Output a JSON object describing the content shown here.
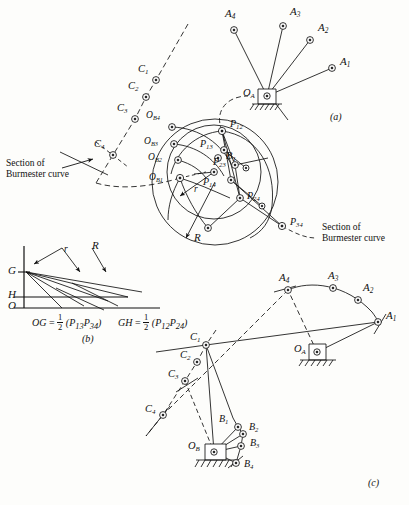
{
  "figure": {
    "subfigures": [
      {
        "id": "a",
        "label": "(a)",
        "x": 330,
        "y": 118
      },
      {
        "id": "b",
        "label": "(b)",
        "x": 84,
        "y": 338
      },
      {
        "id": "c",
        "label": "(c)",
        "x": 370,
        "y": 484
      }
    ]
  },
  "annotations": {
    "section_left": {
      "line1": "Section of",
      "line2": "Burmester curve",
      "x": 6,
      "y": 160
    },
    "section_right": {
      "line1": "Section of",
      "line2": "Burmester curve",
      "x": 320,
      "y": 224
    }
  },
  "formulas": {
    "og": {
      "lhs": "OG",
      "eq": "=",
      "num": "1",
      "den": "2",
      "rhs": "(P",
      "s1": "13",
      "rhs2": "P",
      "s2": "34",
      "rhs3": ")"
    },
    "gh": {
      "lhs": "GH",
      "eq": "=",
      "num": "1",
      "den": "2",
      "rhs": "(P",
      "s1": "12",
      "rhs2": "P",
      "s2": "24",
      "rhs3": ")"
    },
    "og_text": "OG = 1/2 (P13 P34)",
    "gh_text": "GH = 1/2 (P12 P24)"
  },
  "points_a": {
    "A": [
      {
        "name": "A1",
        "base": "A",
        "sub": "1",
        "cx": 332,
        "cy": 68,
        "lx": 340,
        "ly": 62
      },
      {
        "name": "A2",
        "base": "A",
        "sub": "2",
        "cx": 310,
        "cy": 40,
        "lx": 318,
        "ly": 28
      },
      {
        "name": "A3",
        "base": "A",
        "sub": "3",
        "cx": 283,
        "cy": 26,
        "lx": 290,
        "ly": 12
      },
      {
        "name": "A4",
        "base": "A",
        "sub": "4",
        "cx": 234,
        "cy": 30,
        "lx": 227,
        "ly": 14
      }
    ],
    "pivot": {
      "name": "OA",
      "base": "O",
      "sub": "A",
      "cx": 267,
      "cy": 96,
      "lx": 244,
      "ly": 92
    },
    "C": [
      {
        "name": "C1",
        "base": "C",
        "sub": "1",
        "cx": 156,
        "cy": 80,
        "lx": 140,
        "ly": 70
      },
      {
        "name": "C2",
        "base": "C",
        "sub": "2",
        "cx": 146,
        "cy": 97,
        "lx": 130,
        "ly": 88
      },
      {
        "name": "C3",
        "base": "C",
        "sub": "3",
        "cx": 135,
        "cy": 119,
        "lx": 119,
        "ly": 110
      },
      {
        "name": "C4",
        "base": "C",
        "sub": "4",
        "cx": 113,
        "cy": 155,
        "lx": 96,
        "ly": 146
      }
    ],
    "OB": [
      {
        "name": "OB1",
        "base": "O",
        "sub": "B1",
        "cx": 180,
        "cy": 178,
        "lx": 150,
        "ly": 179
      },
      {
        "name": "OB2",
        "base": "O",
        "sub": "B2",
        "cx": 178,
        "cy": 160,
        "lx": 150,
        "ly": 159
      },
      {
        "name": "OB3",
        "base": "O",
        "sub": "B3",
        "cx": 174,
        "cy": 144,
        "lx": 146,
        "ly": 143
      },
      {
        "name": "OB4",
        "base": "O",
        "sub": "B4",
        "cx": 172,
        "cy": 127,
        "lx": 148,
        "ly": 117
      }
    ],
    "B1": {
      "name": "B1",
      "base": "B",
      "sub": "1",
      "cx": 218,
      "cy": 158,
      "lx": 226,
      "ly": 152
    },
    "P": [
      {
        "name": "P12",
        "base": "P",
        "sub": "12",
        "cx": 222,
        "cy": 131,
        "lx": 230,
        "ly": 122
      },
      {
        "name": "P13",
        "base": "P",
        "sub": "13",
        "cx": 224,
        "cy": 150,
        "lx": 203,
        "ly": 145
      },
      {
        "name": "P23",
        "base": "P",
        "sub": "23",
        "cx": 235,
        "cy": 165,
        "lx": 216,
        "ly": 162
      },
      {
        "name": "P14",
        "base": "P",
        "sub": "14",
        "cx": 231,
        "cy": 180,
        "lx": 206,
        "ly": 183
      },
      {
        "name": "P24",
        "base": "P",
        "sub": "24",
        "cx": 240,
        "cy": 198,
        "lx": 248,
        "ly": 197
      },
      {
        "name": "P34",
        "base": "P",
        "sub": "34",
        "cx": 282,
        "cy": 226,
        "lx": 290,
        "ly": 222
      }
    ],
    "radii": [
      {
        "name": "r",
        "label": "r",
        "x": 194,
        "y": 190
      },
      {
        "name": "R",
        "label": "R",
        "x": 196,
        "y": 238
      }
    ]
  },
  "points_b": {
    "axes": [
      {
        "name": "G",
        "label": "G",
        "x": 10,
        "y": 271
      },
      {
        "name": "H",
        "label": "H",
        "x": 10,
        "y": 294
      },
      {
        "name": "O",
        "label": "O",
        "x": 10,
        "y": 305
      }
    ],
    "radii": [
      {
        "name": "r",
        "label": "r",
        "x": 68,
        "y": 253
      },
      {
        "name": "R",
        "label": "R",
        "x": 96,
        "y": 249
      }
    ]
  },
  "points_c": {
    "A": [
      {
        "name": "A1",
        "base": "A",
        "sub": "1",
        "cx": 378,
        "cy": 322,
        "lx": 386,
        "ly": 316
      },
      {
        "name": "A2",
        "base": "A",
        "sub": "2",
        "cx": 358,
        "cy": 300,
        "lx": 364,
        "ly": 288
      },
      {
        "name": "A3",
        "base": "A",
        "sub": "3",
        "cx": 333,
        "cy": 288,
        "lx": 330,
        "ly": 276
      },
      {
        "name": "A4",
        "base": "A",
        "sub": "4",
        "cx": 288,
        "cy": 290,
        "lx": 281,
        "ly": 278
      }
    ],
    "pivotA": {
      "name": "OA",
      "base": "O",
      "sub": "A",
      "cx": 317,
      "cy": 352,
      "lx": 296,
      "ly": 349
    },
    "C": [
      {
        "name": "C1",
        "base": "C",
        "sub": "1",
        "cx": 206,
        "cy": 345,
        "lx": 192,
        "ly": 338
      },
      {
        "name": "C2",
        "base": "C",
        "sub": "2",
        "cx": 197,
        "cy": 362,
        "lx": 182,
        "ly": 356
      },
      {
        "name": "C3",
        "base": "C",
        "sub": "3",
        "cx": 185,
        "cy": 381,
        "lx": 170,
        "ly": 374
      },
      {
        "name": "C4",
        "base": "C",
        "sub": "4",
        "cx": 163,
        "cy": 415,
        "lx": 147,
        "ly": 410
      }
    ],
    "B": [
      {
        "name": "B1",
        "base": "B",
        "sub": "1",
        "cx": 238,
        "cy": 427,
        "lx": 221,
        "ly": 421
      },
      {
        "name": "B2",
        "base": "B",
        "sub": "2",
        "cx": 243,
        "cy": 434,
        "lx": 249,
        "ly": 428
      },
      {
        "name": "B3",
        "base": "B",
        "sub": "3",
        "cx": 241,
        "cy": 446,
        "lx": 249,
        "ly": 444
      },
      {
        "name": "B4",
        "base": "B",
        "sub": "4",
        "cx": 236,
        "cy": 463,
        "lx": 244,
        "ly": 464
      }
    ],
    "pivotB": {
      "name": "OB",
      "base": "O",
      "sub": "B",
      "cx": 214,
      "cy": 452,
      "lx": 190,
      "ly": 448
    }
  },
  "colors": {
    "ink": "#111111",
    "paper": "#fdfdfb"
  }
}
